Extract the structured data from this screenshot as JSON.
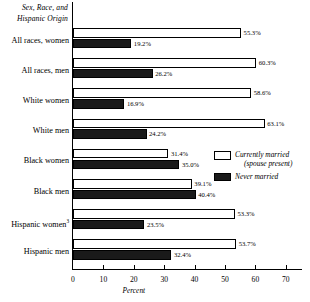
{
  "chart_data": {
    "type": "bar",
    "orientation": "horizontal",
    "title": "",
    "corner_title": "Sex, Race, and Hispanic Origin",
    "xlabel": "Percent",
    "ylabel": "",
    "xlim": [
      0,
      75
    ],
    "xticks": [
      0,
      10,
      20,
      30,
      40,
      50,
      60,
      70
    ],
    "xtick_labels": [
      "0",
      "10",
      "20",
      "30",
      "40",
      "50",
      "60",
      "70"
    ],
    "grid": false,
    "legend_position": "inside-right",
    "categories": [
      "All races, women",
      "All races, men",
      "White women",
      "White men",
      "Black women",
      "Black men",
      "Hispanic women",
      "Hispanic men"
    ],
    "category_footnotes": [
      "",
      "",
      "",
      "",
      "",
      "",
      "3",
      ""
    ],
    "series": [
      {
        "name": "Currently married (spouse present)",
        "color": "#ffffff",
        "values": [
          55.3,
          60.3,
          58.6,
          63.1,
          31.4,
          39.1,
          53.3,
          53.7
        ],
        "labels": [
          "55.3%",
          "60.3%",
          "58.6%",
          "63.1%",
          "31.4%",
          "39.1%",
          "53.3%",
          "53.7%"
        ]
      },
      {
        "name": "Never married",
        "color": "#1a1a1a",
        "values": [
          19.2,
          26.2,
          16.9,
          24.2,
          35.0,
          40.4,
          23.5,
          32.4
        ],
        "labels": [
          "19.2%",
          "26.2%",
          "16.9%",
          "24.2%",
          "35.0%",
          "40.4%",
          "23.5%",
          "32.4%"
        ]
      }
    ]
  },
  "legend": {
    "entries": [
      {
        "line1": "Currently married",
        "line2": "(spouse present)"
      },
      {
        "line1": "Never married",
        "line2": ""
      }
    ]
  }
}
